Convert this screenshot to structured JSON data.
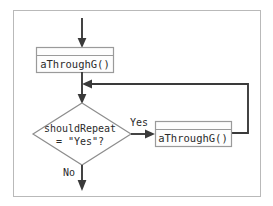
{
  "diagram": {
    "type": "flowchart",
    "frame": {
      "name": "diagram-border"
    },
    "colors": {
      "background": "#ffffff",
      "frame_stroke": "#b9b9b9",
      "shape_stroke": "#9a9a9a",
      "line_stroke": "#3a3a3a",
      "text": "#2b2b2b"
    },
    "nodes": [
      {
        "id": "proc-1",
        "kind": "predefined-process",
        "label": "aThroughG()"
      },
      {
        "id": "decision-1",
        "kind": "decision",
        "label_line_1": "shouldRepeat",
        "label_line_2": "= \"Yes\"?"
      },
      {
        "id": "proc-2",
        "kind": "predefined-process",
        "label": "aThroughG()"
      }
    ],
    "edges": [
      {
        "id": "entry",
        "label": ""
      },
      {
        "id": "proc1-to-decision",
        "label": ""
      },
      {
        "id": "decision-yes",
        "label": "Yes"
      },
      {
        "id": "decision-no",
        "label": "No"
      },
      {
        "id": "loop-back",
        "label": ""
      }
    ]
  }
}
